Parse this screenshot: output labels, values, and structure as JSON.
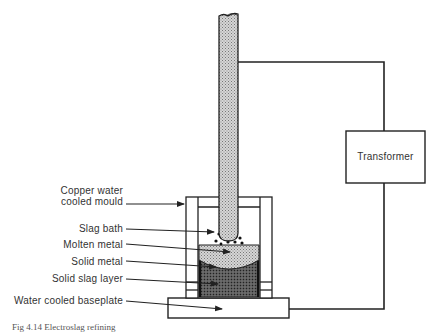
{
  "diagram": {
    "labels": [
      {
        "id": "mould",
        "text_line1": "Copper water",
        "text_line2": "cooled mould"
      },
      {
        "id": "slag_bath",
        "text": "Slag bath"
      },
      {
        "id": "molten_metal",
        "text": "Molten metal"
      },
      {
        "id": "solid_metal",
        "text": "Solid metal"
      },
      {
        "id": "solid_slag_layer",
        "text": "Solid slag layer"
      },
      {
        "id": "baseplate",
        "text": "Water cooled baseplate"
      }
    ],
    "transformer": {
      "label": "Transformer"
    },
    "caption": "Fig 4.14  Electroslag refining"
  },
  "colors": {
    "line": "#222222",
    "electrode_fill": "#b8b8b8",
    "molten_fill": "#c8c8c8",
    "solid_fill": "#4a4a4a",
    "text": "#333333"
  }
}
